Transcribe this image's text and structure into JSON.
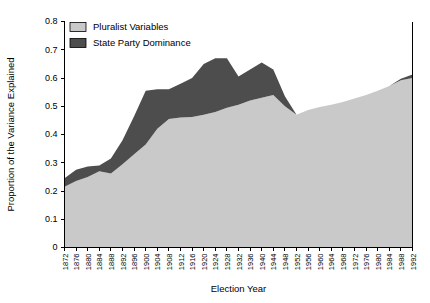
{
  "chart_data": {
    "type": "area",
    "title": "",
    "xlabel": "Election Year",
    "ylabel": "Proportion of the Variance Explained",
    "stacked": true,
    "grid": false,
    "legend_position": "top-left",
    "ylim": [
      0,
      0.8
    ],
    "ytick_labels": [
      "0",
      "0.1",
      "0.2",
      "0.3",
      "0.4",
      "0.5",
      "0.6",
      "0.7",
      "0.8"
    ],
    "ytick_values": [
      0,
      0.1,
      0.2,
      0.3,
      0.4,
      0.5,
      0.6,
      0.7,
      0.8
    ],
    "categories": [
      "1872",
      "1876",
      "1880",
      "1884",
      "1888",
      "1892",
      "1896",
      "1900",
      "1904",
      "1908",
      "1912",
      "1916",
      "1920",
      "1924",
      "1928",
      "1932",
      "1936",
      "1940",
      "1944",
      "1948",
      "1952",
      "1956",
      "1960",
      "1964",
      "1968",
      "1972",
      "1976",
      "1980",
      "1984",
      "1988",
      "1992"
    ],
    "series": [
      {
        "name": "Pluralist Variables",
        "color": "#c9c9c9",
        "values": [
          0.215,
          0.235,
          0.25,
          0.27,
          0.262,
          0.295,
          0.33,
          0.365,
          0.42,
          0.455,
          0.46,
          0.462,
          0.47,
          0.48,
          0.495,
          0.505,
          0.52,
          0.53,
          0.54,
          0.5,
          0.47,
          0.487,
          0.497,
          0.505,
          0.515,
          0.527,
          0.54,
          0.555,
          0.572,
          0.592,
          0.6
        ]
      },
      {
        "name": "State Party Dominance",
        "color": "#4d4d4d",
        "values": [
          0.03,
          0.04,
          0.037,
          0.02,
          0.053,
          0.085,
          0.135,
          0.19,
          0.14,
          0.105,
          0.12,
          0.138,
          0.18,
          0.19,
          0.175,
          0.1,
          0.11,
          0.125,
          0.09,
          0.035,
          0.0,
          0.0,
          0.0,
          0.0,
          0.0,
          0.0,
          0.0,
          0.0,
          0.0,
          0.005,
          0.012
        ]
      }
    ],
    "totals": [
      0.245,
      0.275,
      0.287,
      0.29,
      0.315,
      0.38,
      0.465,
      0.555,
      0.56,
      0.56,
      0.58,
      0.6,
      0.65,
      0.67,
      0.67,
      0.605,
      0.63,
      0.655,
      0.63,
      0.535,
      0.47,
      0.487,
      0.497,
      0.505,
      0.515,
      0.527,
      0.54,
      0.555,
      0.572,
      0.597,
      0.612
    ],
    "legend": [
      {
        "label": "Pluralist Variables",
        "color": "#c9c9c9"
      },
      {
        "label": "State Party Dominance",
        "color": "#4d4d4d"
      }
    ]
  }
}
